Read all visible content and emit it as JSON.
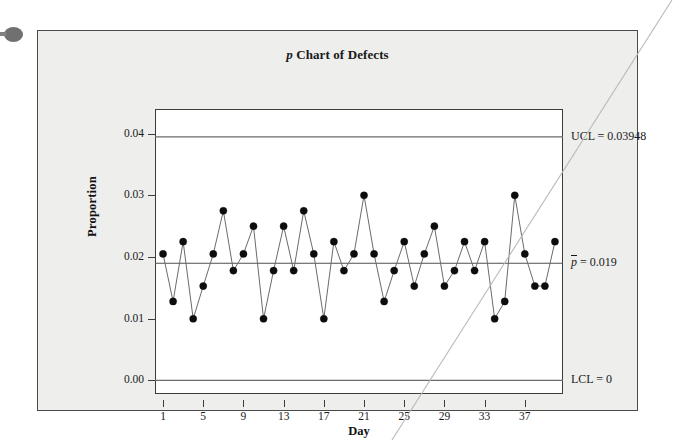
{
  "figure": {
    "title_prefix": "p",
    "title_rest": " Chart of Defects"
  },
  "axes": {
    "y_label": "Proportion",
    "x_label": "Day",
    "y_ticks": [
      "0.04",
      "0.03",
      "0.02",
      "0.01",
      "0.00"
    ],
    "x_ticks": [
      "1",
      "5",
      "9",
      "13",
      "17",
      "21",
      "25",
      "29",
      "33",
      "37"
    ]
  },
  "annotations": {
    "ucl": "UCL = 0.03948",
    "center_symbol": "p",
    "center_rest": " = 0.019",
    "lcl": "LCL = 0"
  },
  "colors": {
    "background": "#eeeeec",
    "plot_background": "#ffffff",
    "frame": "#4a4a4a",
    "axis": "#3c3c3c",
    "line": "#6b6b6b",
    "marker": "#0d0d0d",
    "limit_line": "#6b6b6b",
    "center_line": "#4f4f4f"
  },
  "chart_data": {
    "type": "line",
    "title": "p Chart of Defects",
    "xlabel": "Day",
    "ylabel": "Proportion",
    "xlim": [
      0.2,
      40.8
    ],
    "ylim": [
      -0.0022,
      0.044
    ],
    "grid": false,
    "legend": "none",
    "x": [
      1,
      2,
      3,
      4,
      5,
      6,
      7,
      8,
      9,
      10,
      11,
      12,
      13,
      14,
      15,
      16,
      17,
      18,
      19,
      20,
      21,
      22,
      23,
      24,
      25,
      26,
      27,
      28,
      29,
      30,
      31,
      32,
      33,
      34,
      35,
      36,
      37,
      38,
      39,
      40
    ],
    "series": [
      {
        "name": "Proportion defective",
        "values": [
          0.0205,
          0.0128,
          0.0225,
          0.01,
          0.0153,
          0.0205,
          0.0275,
          0.0178,
          0.0205,
          0.025,
          0.01,
          0.0178,
          0.025,
          0.0178,
          0.0275,
          0.0205,
          0.01,
          0.0225,
          0.0178,
          0.0205,
          0.03,
          0.0205,
          0.0128,
          0.0178,
          0.0225,
          0.0153,
          0.0205,
          0.025,
          0.0153,
          0.0178,
          0.0225,
          0.0178,
          0.0225,
          0.01,
          0.0128,
          0.03,
          0.0205,
          0.0153,
          0.0153,
          0.0225
        ]
      }
    ],
    "reference_lines": [
      {
        "name": "UCL",
        "value": 0.03948,
        "label": "UCL = 0.03948"
      },
      {
        "name": "CL",
        "value": 0.019,
        "label": "p̄ = 0.019"
      },
      {
        "name": "LCL",
        "value": 0.0,
        "label": "LCL = 0"
      }
    ]
  }
}
